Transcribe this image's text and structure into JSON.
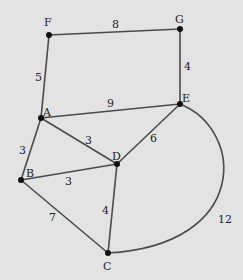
{
  "diagram": {
    "type": "weighted-graph",
    "nodes": [
      {
        "id": "F",
        "label": "F",
        "x": 49,
        "y": 35,
        "lx": 44,
        "ly": 26
      },
      {
        "id": "G",
        "label": "G",
        "x": 180,
        "y": 29,
        "lx": 175,
        "ly": 23
      },
      {
        "id": "A",
        "label": "A",
        "x": 41,
        "y": 118,
        "lx": 43,
        "ly": 116
      },
      {
        "id": "E",
        "label": "E",
        "x": 180,
        "y": 104,
        "lx": 182,
        "ly": 102
      },
      {
        "id": "D",
        "label": "D",
        "x": 117,
        "y": 164,
        "lx": 112,
        "ly": 160
      },
      {
        "id": "B",
        "label": "B",
        "x": 21,
        "y": 180,
        "lx": 26,
        "ly": 177
      },
      {
        "id": "C",
        "label": "C",
        "x": 108,
        "y": 253,
        "lx": 103,
        "ly": 270
      }
    ],
    "edges": [
      {
        "from": "F",
        "to": "G",
        "weight": "8",
        "wx": 112,
        "wy": 28
      },
      {
        "from": "F",
        "to": "A",
        "weight": "5",
        "wx": 35,
        "wy": 81
      },
      {
        "from": "G",
        "to": "E",
        "weight": "4",
        "wx": 184,
        "wy": 70
      },
      {
        "from": "A",
        "to": "E",
        "weight": "9",
        "wx": 107,
        "wy": 107
      },
      {
        "from": "A",
        "to": "D",
        "weight": "3",
        "wx": 85,
        "wy": 144
      },
      {
        "from": "A",
        "to": "B",
        "weight": "3",
        "wx": 19,
        "wy": 154
      },
      {
        "from": "E",
        "to": "D",
        "weight": "6",
        "wx": 150,
        "wy": 142
      },
      {
        "from": "B",
        "to": "D",
        "weight": "3",
        "wx": 65,
        "wy": 185
      },
      {
        "from": "B",
        "to": "C",
        "weight": "7",
        "wx": 49,
        "wy": 221
      },
      {
        "from": "D",
        "to": "C",
        "weight": "4",
        "wx": 102,
        "wy": 214
      },
      {
        "from": "E",
        "to": "C",
        "weight": "12",
        "wx": 218,
        "wy": 223,
        "curved": true
      }
    ]
  }
}
